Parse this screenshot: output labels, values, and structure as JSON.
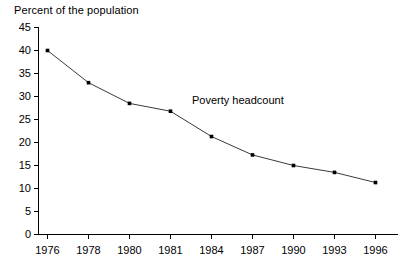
{
  "chart_data": {
    "type": "line",
    "title": "Percent of the population",
    "xlabel": "",
    "ylabel": "",
    "ylim": [
      0,
      45
    ],
    "ytick_step": 5,
    "grid": false,
    "legend_position": "none",
    "categories": [
      "1976",
      "1978",
      "1980",
      "1981",
      "1984",
      "1987",
      "1990",
      "1993",
      "1996"
    ],
    "yticks": [
      "0",
      "5",
      "10",
      "15",
      "20",
      "25",
      "30",
      "35",
      "40",
      "45"
    ],
    "series": [
      {
        "name": "Poverty headcount",
        "values": [
          40.0,
          33.0,
          28.5,
          26.8,
          21.3,
          17.3,
          15.0,
          13.5,
          11.3
        ],
        "marker": "square",
        "color": "#3a3a3a"
      }
    ],
    "annotations": [
      {
        "text": "Poverty headcount",
        "x_category": "1981",
        "value_near": 27
      }
    ]
  }
}
